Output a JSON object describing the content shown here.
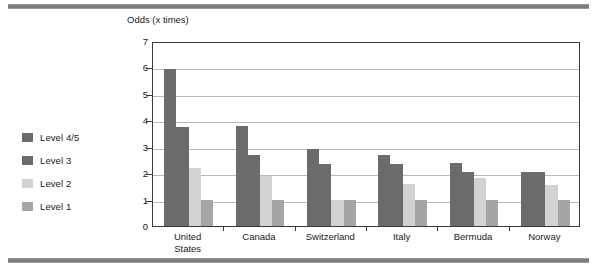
{
  "figure": {
    "rule_top": "",
    "rule_bottom": ""
  },
  "axis_title": "Odds (x times)",
  "legend": {
    "items": [
      {
        "label": "Level 4/5",
        "color": "#6b6b6b"
      },
      {
        "label": "Level 3",
        "color": "#6b6b6b"
      },
      {
        "label": "Level 2",
        "color": "#d2d2d2"
      },
      {
        "label": "Level 1",
        "color": "#a5a5a5"
      }
    ]
  },
  "chart_data": {
    "type": "bar",
    "title": "",
    "subtitle": "",
    "xlabel": "",
    "ylabel": "Odds (x times)",
    "ylim": [
      0,
      7
    ],
    "ytick_labels": [
      "7",
      "6",
      "5",
      "4",
      "3",
      "2",
      "1",
      "0"
    ],
    "ytick_values": [
      7,
      6,
      5,
      4,
      3,
      2,
      1,
      0
    ],
    "grid": true,
    "grid_axis": "y",
    "legend_position": "left",
    "categories": [
      "United States",
      "Canada",
      "Switzerland",
      "Italy",
      "Bermuda",
      "Norway"
    ],
    "category_lines": [
      [
        "United",
        "States"
      ],
      [
        "Canada"
      ],
      [
        "Switzerland"
      ],
      [
        "Italy"
      ],
      [
        "Bermuda"
      ],
      [
        "Norway"
      ]
    ],
    "series": [
      {
        "name": "Level 4/5",
        "color": "#6b6b6b",
        "values": [
          5.95,
          3.8,
          2.9,
          2.7,
          2.4,
          2.05
        ]
      },
      {
        "name": "Level 3",
        "color": "#6b6b6b",
        "values": [
          3.75,
          2.7,
          2.35,
          2.35,
          2.05,
          2.05
        ]
      },
      {
        "name": "Level 2",
        "color": "#d2d2d2",
        "values": [
          2.2,
          1.9,
          1.0,
          1.6,
          1.8,
          1.55
        ]
      },
      {
        "name": "Level 1",
        "color": "#a5a5a5",
        "values": [
          1.0,
          1.0,
          1.0,
          1.0,
          1.0,
          1.0
        ]
      }
    ]
  }
}
